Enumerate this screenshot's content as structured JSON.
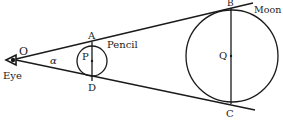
{
  "diagram": {
    "labels": {
      "eye": "Eye",
      "observer_point": "O",
      "angle": "α",
      "pencil": "Pencil",
      "pencil_center": "P",
      "pencil_top": "A",
      "pencil_bottom": "D",
      "moon": "Moon",
      "moon_center": "Q",
      "moon_top": "B",
      "moon_bottom": "C"
    },
    "colors": {
      "stroke": "#1a1a1a",
      "background": "#ffffff"
    }
  }
}
